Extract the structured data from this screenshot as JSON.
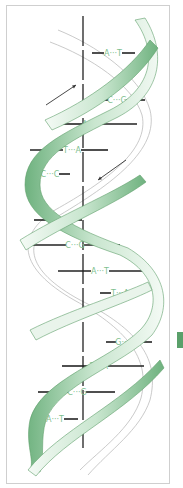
{
  "diagram": {
    "colors": {
      "ribbon_front": "#7fc08e",
      "ribbon_light": "#e6f3e8",
      "ribbon_edge": "#5f9f6c",
      "axis": "#222222",
      "bond": "#222222",
      "label": "#7fbf8f",
      "frame": "#cfcfcf",
      "marker": "#5aa06a"
    },
    "arrows": [
      {
        "name": "strand-direction-up",
        "x1": 46,
        "y1": 105,
        "x2": 76,
        "y2": 85
      },
      {
        "name": "strand-direction-down",
        "x1": 126,
        "y1": 160,
        "x2": 98,
        "y2": 180
      }
    ],
    "base_pairs": [
      {
        "left": "A",
        "right": "T",
        "y": 53,
        "x1": 92,
        "x2": 135,
        "lx": 113
      },
      {
        "left": "C",
        "right": "G",
        "y": 100,
        "x1": 92,
        "x2": 145,
        "lx": 117
      },
      {
        "left": "A",
        "right": "T",
        "y": 124,
        "x1": 54,
        "x2": 137,
        "lx": 91
      },
      {
        "left": "T",
        "right": "A",
        "y": 150,
        "x1": 30,
        "x2": 108,
        "lx": 72
      },
      {
        "left": "C",
        "right": "C",
        "y": 174,
        "x1": 30,
        "x2": 70,
        "lx": 50
      },
      {
        "left": "C",
        "right": "G",
        "y": 220,
        "x1": 34,
        "x2": 82,
        "lx": 58
      },
      {
        "left": "C",
        "right": "G",
        "y": 245,
        "x1": 30,
        "x2": 120,
        "lx": 75
      },
      {
        "left": "A",
        "right": "T",
        "y": 271,
        "x1": 58,
        "x2": 148,
        "lx": 100
      },
      {
        "left": "T",
        "right": "A",
        "y": 293,
        "x1": 100,
        "x2": 140,
        "lx": 120
      },
      {
        "left": "G",
        "right": "C",
        "y": 342,
        "x1": 106,
        "x2": 152,
        "lx": 125
      },
      {
        "left": "T",
        "right": "A",
        "y": 366,
        "x1": 62,
        "x2": 144,
        "lx": 99
      },
      {
        "left": "C",
        "right": "G",
        "y": 392,
        "x1": 38,
        "x2": 115,
        "lx": 77
      },
      {
        "left": "A",
        "right": "T",
        "y": 419,
        "x1": 34,
        "x2": 78,
        "lx": 55
      }
    ]
  }
}
